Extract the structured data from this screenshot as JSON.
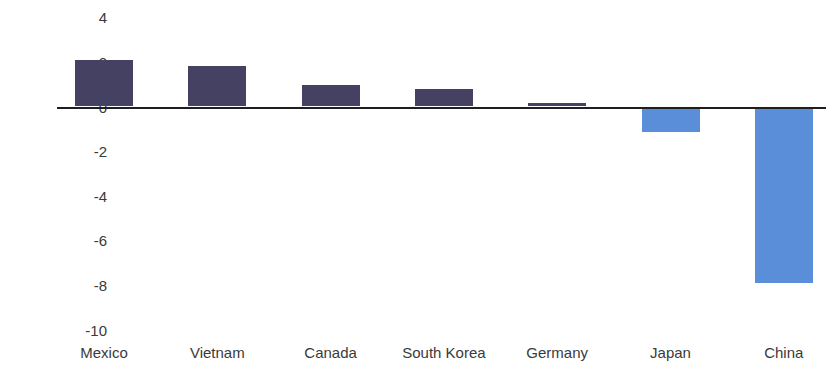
{
  "caption": {
    "clipped_text": ""
  },
  "chart_data": {
    "type": "bar",
    "title": "",
    "subtitle": "",
    "xlabel": "",
    "ylabel": "",
    "categories": [
      "Mexico",
      "Vietnam",
      "Canada",
      "South Korea",
      "Germany",
      "Japan",
      "China"
    ],
    "values": [
      2.1,
      1.8,
      0.95,
      0.8,
      0.15,
      -1.15,
      -7.9
    ],
    "ylim": [
      -10,
      4
    ],
    "yticks": [
      4,
      2,
      0,
      -2,
      -4,
      -6,
      -8,
      -10
    ],
    "ytick_labels": [
      "4",
      "2",
      "0",
      "-2",
      "-4",
      "-6",
      "-8",
      "-10"
    ],
    "grid": false,
    "legend": null,
    "zero_line": 0,
    "colors": {
      "positive": "#454163",
      "negative": "#5b8ed9",
      "axis": "#1d1d22",
      "text": "#3a3a3a"
    }
  }
}
